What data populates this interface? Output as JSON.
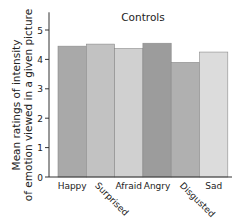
{
  "chart_data": {
    "type": "bar",
    "title": "Controls",
    "xlabel": "",
    "ylabel": "Mean ratings of intensity of emotion viewed in a given picture",
    "ylabel_lines": [
      "Mean ratings of intensity",
      "of emotion viewed in a given picture"
    ],
    "categories": [
      "Happy",
      "Surprised",
      "Afraid",
      "Angry",
      "Disgusted",
      "Sad"
    ],
    "values": [
      4.45,
      4.52,
      4.37,
      4.55,
      3.9,
      4.25
    ],
    "bar_colors": [
      "#a9a9a9",
      "#c2c2c2",
      "#d0d0d0",
      "#9c9c9c",
      "#b0b0b0",
      "#dcdcdc"
    ],
    "ylim": [
      0,
      5.5
    ],
    "yticks": [
      0,
      1,
      2,
      3,
      4,
      5
    ],
    "rotated_labels": [
      "Surprised",
      "Disgusted"
    ],
    "grid": false,
    "legend": null
  }
}
